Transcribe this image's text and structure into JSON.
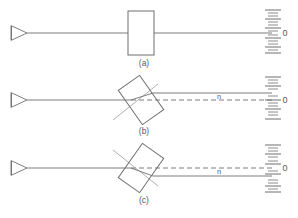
{
  "figure": {
    "background_color": "#ffffff",
    "line_color": "#6e6e6e",
    "dash_color": "#6e6e6e",
    "normal_color": "#9a9a9a",
    "text_color": "#5a5a5a"
  },
  "panels": [
    {
      "id": "a",
      "caption": "(a)",
      "source_icon": "beam-source-triangle-icon",
      "block": {
        "icon": "glass-plate-icon",
        "orientation": "upright",
        "tilt_deg": 0
      },
      "rays": [
        {
          "kind": "incident",
          "style": "solid",
          "label": ""
        },
        {
          "kind": "transmitted",
          "style": "solid",
          "label": ""
        }
      ],
      "ray_label": "",
      "scale": {
        "icon": "ruler-scale-icon",
        "zero_label": "0",
        "major_ticks": 5,
        "minor_ticks_per_major": 3
      }
    },
    {
      "id": "b",
      "caption": "(b)",
      "source_icon": "beam-source-triangle-icon",
      "block": {
        "icon": "glass-plate-icon",
        "orientation": "tilted-counterclockwise",
        "tilt_deg": -35
      },
      "rays": [
        {
          "kind": "incident",
          "style": "solid",
          "label": ""
        },
        {
          "kind": "transmitted",
          "style": "solid",
          "label": "n"
        },
        {
          "kind": "reference-axis",
          "style": "dashed",
          "label": ""
        }
      ],
      "ray_label": "n",
      "scale": {
        "icon": "ruler-scale-icon",
        "zero_label": "0",
        "major_ticks": 5,
        "minor_ticks_per_major": 3
      }
    },
    {
      "id": "c",
      "caption": "(c)",
      "source_icon": "beam-source-triangle-icon",
      "block": {
        "icon": "glass-plate-icon",
        "orientation": "tilted-clockwise",
        "tilt_deg": 35
      },
      "rays": [
        {
          "kind": "incident",
          "style": "solid",
          "label": ""
        },
        {
          "kind": "transmitted",
          "style": "solid",
          "label": "n"
        },
        {
          "kind": "reference-axis",
          "style": "dashed",
          "label": ""
        }
      ],
      "ray_label": "n",
      "scale": {
        "icon": "ruler-scale-icon",
        "zero_label": "0",
        "major_ticks": 5,
        "minor_ticks_per_major": 3
      }
    }
  ]
}
